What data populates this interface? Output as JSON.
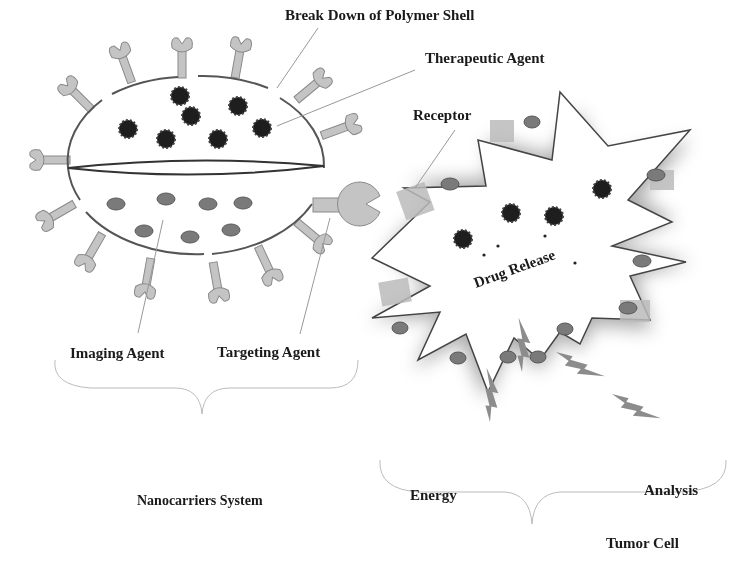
{
  "diagram": {
    "labels": {
      "break_down": "Break Down of Polymer Shell",
      "therapeutic_agent": "Therapeutic Agent",
      "receptor": "Receptor",
      "drug_release": "Drug Release",
      "imaging_agent": "Imaging Agent",
      "targeting_agent": "Targeting Agent",
      "nanocarriers_system": "Nanocarriers System",
      "energy": "Energy",
      "analysis": "Analysis",
      "tumor_cell": "Tumor Cell"
    },
    "colors": {
      "drug_particle": "#1e1e1e",
      "imaging_particle": "#7a7a7a",
      "ligand": "#bdbdbd",
      "outline": "#555555",
      "bolt": "#8c8c8c"
    }
  }
}
